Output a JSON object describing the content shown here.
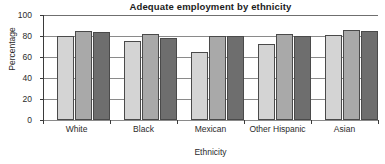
{
  "chart_data": {
    "type": "bar",
    "title": "Adequate employment by ethnicity",
    "xlabel": "Ethnicity",
    "ylabel": "Percentage",
    "categories": [
      "White",
      "Black",
      "Mexican",
      "Other Hispanic",
      "Asian"
    ],
    "series": [
      {
        "name": "series-1",
        "color": "#d4d4d4",
        "values": [
          80,
          75,
          65,
          72,
          81
        ]
      },
      {
        "name": "series-2",
        "color": "#a9a9a9",
        "values": [
          85,
          82,
          80,
          82,
          86
        ]
      },
      {
        "name": "series-3",
        "color": "#6e6e6e",
        "values": [
          84,
          78,
          80,
          80,
          85
        ]
      }
    ],
    "ylim": [
      0,
      100
    ],
    "yticks": [
      0,
      20,
      40,
      60,
      80,
      100
    ],
    "ytick_labels": [
      "0",
      "20",
      "40",
      "60",
      "80",
      "100"
    ],
    "grid": true,
    "legend": "none"
  }
}
